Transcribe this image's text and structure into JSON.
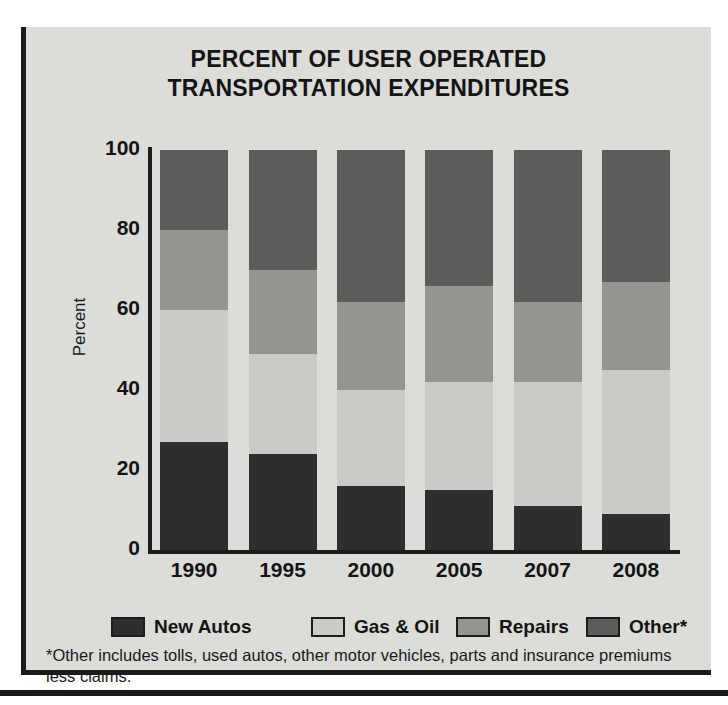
{
  "chart_data": {
    "type": "bar",
    "stacked": true,
    "title": "PERCENT OF USER OPERATED TRANSPORTATION EXPENDITURES",
    "title_lines": [
      "PERCENT OF USER OPERATED",
      "TRANSPORTATION EXPENDITURES"
    ],
    "xlabel": "",
    "ylabel": "Percent",
    "ylim": [
      0,
      100
    ],
    "yticks": [
      100,
      80,
      60,
      40,
      20,
      0
    ],
    "ytick_labels": [
      "100",
      "80",
      "60",
      "40",
      "20",
      "0"
    ],
    "grid": false,
    "legend_position": "bottom",
    "categories": [
      "1990",
      "1995",
      "2000",
      "2005",
      "2007",
      "2008"
    ],
    "series": [
      {
        "name": "New Autos",
        "color": "#2e2e2e",
        "values": [
          27,
          24,
          16,
          15,
          11,
          9
        ]
      },
      {
        "name": "Gas & Oil",
        "color": "#cacac6",
        "values": [
          33,
          25,
          24,
          27,
          31,
          36
        ]
      },
      {
        "name": "Repairs",
        "color": "#949490",
        "values": [
          20,
          21,
          22,
          24,
          20,
          22
        ]
      },
      {
        "name": "Other*",
        "color": "#5c5c5a",
        "values": [
          20,
          30,
          38,
          34,
          38,
          33
        ]
      }
    ],
    "annotations": [
      "*Other includes tolls, used autos, other motor vehicles, parts and insurance premiums less claims."
    ]
  },
  "legend": {
    "items": [
      {
        "label": "New Autos",
        "color": "#2e2e2e"
      },
      {
        "label": "Gas & Oil",
        "color": "#cacac6"
      },
      {
        "label": "Repairs",
        "color": "#949490"
      },
      {
        "label": "Other*",
        "color": "#5c5c5a"
      }
    ]
  },
  "footnote": {
    "text": "*Other includes tolls, used autos, other motor vehicles, parts and insurance premiums less claims."
  },
  "colors": {
    "panel_background": "#dcdcd8",
    "ink": "#141414",
    "frame": "#1b1b1b"
  }
}
